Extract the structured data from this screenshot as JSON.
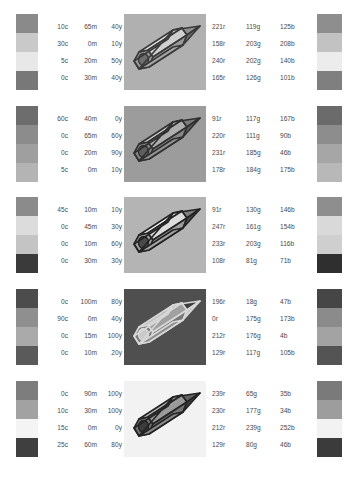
{
  "page": {
    "background": "#ffffff",
    "text_color": "#4a4a4a"
  },
  "rows": [
    {
      "id": "row-1",
      "left_swatches": [
        "#8a8a8a",
        "#c9c9c9",
        "#e8e8e8",
        "#787878"
      ],
      "cmyk": [
        {
          "c": "10c",
          "m": "65m",
          "y": "40y",
          "k": "0k"
        },
        {
          "c": "30c",
          "m": "0m",
          "y": "10y",
          "k": "10k"
        },
        {
          "c": "5c",
          "m": "20m",
          "y": "50y",
          "k": "0k"
        },
        {
          "c": "0c",
          "m": "30m",
          "y": "40y",
          "k": "40k"
        }
      ],
      "rgb": [
        {
          "r": "221r",
          "g": "119g",
          "b": "125b"
        },
        {
          "r": "158r",
          "g": "203g",
          "b": "208b"
        },
        {
          "r": "240r",
          "g": "202g",
          "b": "140b"
        },
        {
          "r": "165r",
          "g": "126g",
          "b": "101b"
        }
      ],
      "right_swatches": [
        "#8e8e8e",
        "#c2c2c2",
        "#ececec",
        "#7f7f7f"
      ],
      "pencil": {
        "background": "#b0b0b0",
        "body_light": "#e6e6e6",
        "body_mid": "#cfcfcf",
        "body_dark": "#9a9a9a",
        "tip": "#8f8f8f",
        "lead": "#6e6e6e",
        "ferrule": "#a8a8a8",
        "outline": "#3a3a3a"
      }
    },
    {
      "id": "row-2",
      "left_swatches": [
        "#6d6d6d",
        "#8c8c8c",
        "#9f9f9f",
        "#b4b4b4"
      ],
      "cmyk": [
        {
          "c": "60c",
          "m": "40m",
          "y": "0y",
          "k": "20k"
        },
        {
          "c": "0c",
          "m": "65m",
          "y": "60y",
          "k": "10k"
        },
        {
          "c": "0c",
          "m": "20m",
          "y": "90y",
          "k": "10k"
        },
        {
          "c": "5c",
          "m": "0m",
          "y": "10y",
          "k": "30k"
        }
      ],
      "rgb": [
        {
          "r": "91r",
          "g": "117g",
          "b": "167b"
        },
        {
          "r": "220r",
          "g": "111g",
          "b": "90b"
        },
        {
          "r": "231r",
          "g": "185g",
          "b": "46b"
        },
        {
          "r": "178r",
          "g": "184g",
          "b": "175b"
        }
      ],
      "right_swatches": [
        "#6b6b6b",
        "#8d8d8d",
        "#a6a6a6",
        "#b8b8b8"
      ],
      "pencil": {
        "background": "#9c9c9c",
        "body_light": "#c6c6c6",
        "body_mid": "#aeaeae",
        "body_dark": "#868686",
        "tip": "#7a7a7a",
        "lead": "#5e5e5e",
        "ferrule": "#949494",
        "outline": "#303030"
      }
    },
    {
      "id": "row-3",
      "left_swatches": [
        "#8b8b8b",
        "#dcdcdc",
        "#c4c4c4",
        "#3a3a3a"
      ],
      "cmyk": [
        {
          "c": "45c",
          "m": "10m",
          "y": "10y",
          "k": "40k"
        },
        {
          "c": "0c",
          "m": "45m",
          "y": "30y",
          "k": "0k"
        },
        {
          "c": "0c",
          "m": "10m",
          "y": "60y",
          "k": "10k"
        },
        {
          "c": "0c",
          "m": "30m",
          "y": "30y",
          "k": "70k"
        }
      ],
      "rgb": [
        {
          "r": "91r",
          "g": "130g",
          "b": "146b"
        },
        {
          "r": "247r",
          "g": "161g",
          "b": "154b"
        },
        {
          "r": "233r",
          "g": "203g",
          "b": "116b"
        },
        {
          "r": "108r",
          "g": "81g",
          "b": "71b"
        }
      ],
      "right_swatches": [
        "#8e8e8e",
        "#d9d9d9",
        "#cfcfcf",
        "#2f2f2f"
      ],
      "pencil": {
        "background": "#b4b4b4",
        "body_light": "#f0f0f0",
        "body_mid": "#dcdcdc",
        "body_dark": "#9e9e9e",
        "tip": "#7d7d7d",
        "lead": "#4a4a4a",
        "ferrule": "#a5a5a5",
        "outline": "#232323"
      }
    },
    {
      "id": "row-4",
      "left_swatches": [
        "#4c4c4c",
        "#8f8f8f",
        "#aaaaaa",
        "#5a5a5a"
      ],
      "cmyk": [
        {
          "c": "0c",
          "m": "100m",
          "y": "80y",
          "k": "20k"
        },
        {
          "c": "90c",
          "m": "0m",
          "y": "40y",
          "k": "0k"
        },
        {
          "c": "0c",
          "m": "15m",
          "y": "100y",
          "k": "20k"
        },
        {
          "c": "0c",
          "m": "10m",
          "y": "20y",
          "k": "60k"
        }
      ],
      "rgb": [
        {
          "r": "196r",
          "g": "18g",
          "b": "47b"
        },
        {
          "r": "0r",
          "g": "175g",
          "b": "173b"
        },
        {
          "r": "212r",
          "g": "176g",
          "b": "4b"
        },
        {
          "r": "129r",
          "g": "117g",
          "b": "105b"
        }
      ],
      "right_swatches": [
        "#464646",
        "#8b8b8b",
        "#a3a3a3",
        "#545454"
      ],
      "pencil": {
        "background": "#4f4f4f",
        "body_light": "#bdbdbd",
        "body_mid": "#a0a0a0",
        "body_dark": "#787878",
        "tip": "#3c3c3c",
        "lead": "#c9c9c9",
        "ferrule": "#8d8d8d",
        "outline": "#d8d8d8"
      }
    },
    {
      "id": "row-5",
      "left_swatches": [
        "#7d7d7d",
        "#a2a2a2",
        "#f4f4f4",
        "#3f3f3f"
      ],
      "cmyk": [
        {
          "c": "0c",
          "m": "90m",
          "y": "100y",
          "k": "0k"
        },
        {
          "c": "10c",
          "m": "30m",
          "y": "100y",
          "k": "0k"
        },
        {
          "c": "15c",
          "m": "0m",
          "y": "0y",
          "k": "0k"
        },
        {
          "c": "25c",
          "m": "60m",
          "y": "80y",
          "k": "40k"
        }
      ],
      "rgb": [
        {
          "r": "239r",
          "g": "65g",
          "b": "35b"
        },
        {
          "r": "230r",
          "g": "177g",
          "b": "34b"
        },
        {
          "r": "212r",
          "g": "239g",
          "b": "252b"
        },
        {
          "r": "129r",
          "g": "80g",
          "b": "46b"
        }
      ],
      "right_swatches": [
        "#7a7a7a",
        "#9d9d9d",
        "#f2f2f2",
        "#3b3b3b"
      ],
      "pencil": {
        "background": "#f2f2f2",
        "body_light": "#b5b5b5",
        "body_mid": "#9a9a9a",
        "body_dark": "#737373",
        "tip": "#636363",
        "lead": "#3c3c3c",
        "ferrule": "#8a8a8a",
        "outline": "#242424"
      }
    }
  ]
}
